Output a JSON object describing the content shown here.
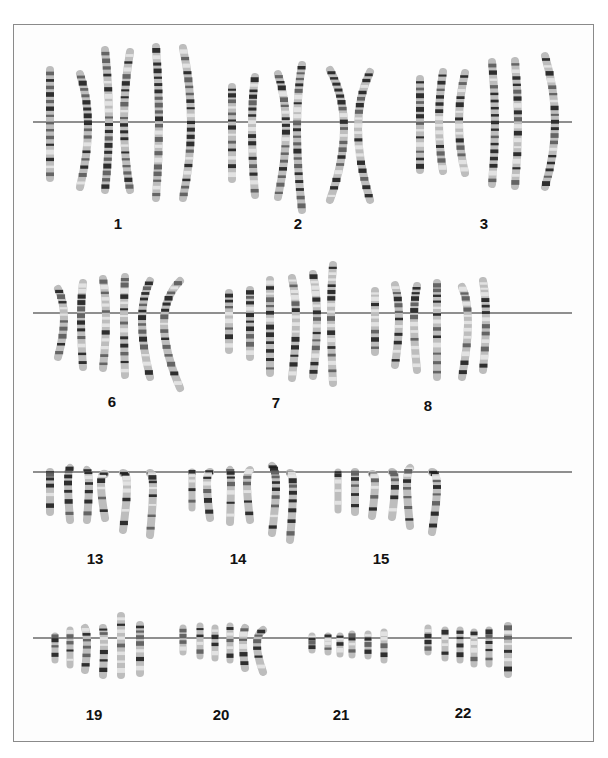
{
  "figure": {
    "type": "karyogram"
  },
  "rows": [
    {
      "line_y": 122,
      "line_x": [
        33,
        572
      ],
      "groups": [
        {
          "label": "1",
          "label_x": 118,
          "label_y": 225,
          "chromosomes": [
            {
              "x": 50,
              "top": 70,
              "bottom": 178,
              "bend": 0
            },
            {
              "x": 80,
              "top": 74,
              "bottom": 187,
              "bend": 8
            },
            {
              "x": 105,
              "top": 50,
              "bottom": 190,
              "bend": 4
            },
            {
              "x": 130,
              "top": 52,
              "bottom": 190,
              "bend": -6
            },
            {
              "x": 156,
              "top": 47,
              "bottom": 198,
              "bend": 3
            },
            {
              "x": 183,
              "top": 48,
              "bottom": 198,
              "bend": 8
            }
          ]
        },
        {
          "label": "2",
          "label_x": 298,
          "label_y": 225,
          "chromosomes": [
            {
              "x": 232,
              "top": 87,
              "bottom": 179,
              "bend": 0
            },
            {
              "x": 255,
              "top": 77,
              "bottom": 195,
              "bend": -3
            },
            {
              "x": 278,
              "top": 74,
              "bottom": 197,
              "bend": 8
            },
            {
              "x": 302,
              "top": 65,
              "bottom": 210,
              "bend": -5
            },
            {
              "x": 330,
              "top": 70,
              "bottom": 200,
              "bend": 14
            },
            {
              "x": 370,
              "top": 72,
              "bottom": 200,
              "bend": -12
            }
          ]
        },
        {
          "label": "3",
          "label_x": 484,
          "label_y": 225,
          "chromosomes": [
            {
              "x": 420,
              "top": 79,
              "bottom": 170,
              "bend": 0
            },
            {
              "x": 443,
              "top": 72,
              "bottom": 171,
              "bend": -4
            },
            {
              "x": 465,
              "top": 73,
              "bottom": 173,
              "bend": -6
            },
            {
              "x": 492,
              "top": 62,
              "bottom": 184,
              "bend": 3
            },
            {
              "x": 515,
              "top": 61,
              "bottom": 186,
              "bend": 3
            },
            {
              "x": 545,
              "top": 56,
              "bottom": 187,
              "bend": 10
            }
          ]
        }
      ]
    },
    {
      "line_y": 313,
      "line_x": [
        33,
        572
      ],
      "groups": [
        {
          "label": "6",
          "label_x": 112,
          "label_y": 403,
          "chromosomes": [
            {
              "x": 58,
              "top": 289,
              "bottom": 357,
              "bend": 6
            },
            {
              "x": 83,
              "top": 283,
              "bottom": 367,
              "bend": -2
            },
            {
              "x": 103,
              "top": 279,
              "bottom": 368,
              "bend": 3
            },
            {
              "x": 125,
              "top": 277,
              "bottom": 375,
              "bend": -1
            },
            {
              "x": 150,
              "top": 281,
              "bottom": 377,
              "bend": -8
            },
            {
              "x": 180,
              "top": 281,
              "bottom": 388,
              "bend": -16
            }
          ]
        },
        {
          "label": "7",
          "label_x": 276,
          "label_y": 404,
          "chromosomes": [
            {
              "x": 229,
              "top": 293,
              "bottom": 350,
              "bend": 0
            },
            {
              "x": 250,
              "top": 290,
              "bottom": 357,
              "bend": 0
            },
            {
              "x": 270,
              "top": 280,
              "bottom": 373,
              "bend": 0
            },
            {
              "x": 292,
              "top": 278,
              "bottom": 378,
              "bend": 4
            },
            {
              "x": 313,
              "top": 274,
              "bottom": 376,
              "bend": 4
            },
            {
              "x": 333,
              "top": 265,
              "bottom": 383,
              "bend": -2
            }
          ]
        },
        {
          "label": "8",
          "label_x": 428,
          "label_y": 407,
          "chromosomes": [
            {
              "x": 375,
              "top": 291,
              "bottom": 352,
              "bend": 0
            },
            {
              "x": 395,
              "top": 285,
              "bottom": 365,
              "bend": 4
            },
            {
              "x": 417,
              "top": 286,
              "bottom": 370,
              "bend": -3
            },
            {
              "x": 437,
              "top": 283,
              "bottom": 377,
              "bend": 0
            },
            {
              "x": 462,
              "top": 287,
              "bottom": 377,
              "bend": 6
            },
            {
              "x": 483,
              "top": 281,
              "bottom": 370,
              "bend": 3
            }
          ]
        }
      ]
    },
    {
      "line_y": 472,
      "line_x": [
        33,
        572
      ],
      "groups": [
        {
          "label": "13",
          "label_x": 95,
          "label_y": 560,
          "chromosomes": [
            {
              "x": 50,
              "top": 472,
              "bottom": 512,
              "bend": 0
            },
            {
              "x": 70,
              "top": 468,
              "bottom": 520,
              "bend": -2
            },
            {
              "x": 87,
              "top": 470,
              "bottom": 520,
              "bend": 2
            },
            {
              "x": 105,
              "top": 474,
              "bottom": 518,
              "bend": -4
            },
            {
              "x": 123,
              "top": 473,
              "bottom": 530,
              "bend": 4
            },
            {
              "x": 150,
              "top": 473,
              "bottom": 535,
              "bend": 3
            }
          ]
        },
        {
          "label": "14",
          "label_x": 238,
          "label_y": 560,
          "chromosomes": [
            {
              "x": 192,
              "top": 472,
              "bottom": 508,
              "bend": 0
            },
            {
              "x": 210,
              "top": 472,
              "bottom": 518,
              "bend": -3
            },
            {
              "x": 230,
              "top": 470,
              "bottom": 522,
              "bend": 1
            },
            {
              "x": 250,
              "top": 470,
              "bottom": 520,
              "bend": -3
            },
            {
              "x": 272,
              "top": 466,
              "bottom": 533,
              "bend": 4
            },
            {
              "x": 290,
              "top": 473,
              "bottom": 540,
              "bend": 3
            }
          ]
        },
        {
          "label": "15",
          "label_x": 381,
          "label_y": 560,
          "chromosomes": [
            {
              "x": 338,
              "top": 472,
              "bottom": 510,
              "bend": 0
            },
            {
              "x": 355,
              "top": 472,
              "bottom": 512,
              "bend": 0
            },
            {
              "x": 372,
              "top": 474,
              "bottom": 516,
              "bend": 3
            },
            {
              "x": 392,
              "top": 472,
              "bottom": 517,
              "bend": 3
            },
            {
              "x": 410,
              "top": 468,
              "bottom": 526,
              "bend": -3
            },
            {
              "x": 432,
              "top": 472,
              "bottom": 532,
              "bend": 5
            }
          ]
        }
      ]
    },
    {
      "line_y": 638,
      "line_x": [
        33,
        572
      ],
      "groups": [
        {
          "label": "19",
          "label_x": 94,
          "label_y": 716,
          "chromosomes": [
            {
              "x": 55,
              "top": 636,
              "bottom": 660,
              "bend": 0
            },
            {
              "x": 70,
              "top": 630,
              "bottom": 665,
              "bend": 0
            },
            {
              "x": 85,
              "top": 628,
              "bottom": 670,
              "bend": 2
            },
            {
              "x": 103,
              "top": 628,
              "bottom": 675,
              "bend": 1
            },
            {
              "x": 121,
              "top": 616,
              "bottom": 675,
              "bend": 0
            },
            {
              "x": 140,
              "top": 625,
              "bottom": 673,
              "bend": 0
            }
          ]
        },
        {
          "label": "20",
          "label_x": 221,
          "label_y": 716,
          "chromosomes": [
            {
              "x": 183,
              "top": 628,
              "bottom": 652,
              "bend": 0
            },
            {
              "x": 200,
              "top": 626,
              "bottom": 656,
              "bend": 0
            },
            {
              "x": 215,
              "top": 628,
              "bottom": 658,
              "bend": 0
            },
            {
              "x": 230,
              "top": 626,
              "bottom": 660,
              "bend": 0
            },
            {
              "x": 245,
              "top": 628,
              "bottom": 668,
              "bend": -2
            },
            {
              "x": 263,
              "top": 630,
              "bottom": 672,
              "bend": -6
            }
          ]
        },
        {
          "label": "21",
          "label_x": 341,
          "label_y": 716,
          "chromosomes": [
            {
              "x": 312,
              "top": 636,
              "bottom": 650,
              "bend": 0
            },
            {
              "x": 328,
              "top": 636,
              "bottom": 652,
              "bend": 0
            },
            {
              "x": 340,
              "top": 636,
              "bottom": 654,
              "bend": 0
            },
            {
              "x": 352,
              "top": 634,
              "bottom": 655,
              "bend": 0
            },
            {
              "x": 368,
              "top": 634,
              "bottom": 656,
              "bend": 0
            },
            {
              "x": 384,
              "top": 632,
              "bottom": 660,
              "bend": 0
            }
          ]
        },
        {
          "label": "22",
          "label_x": 463,
          "label_y": 714,
          "chromosomes": [
            {
              "x": 428,
              "top": 628,
              "bottom": 652,
              "bend": 0
            },
            {
              "x": 445,
              "top": 630,
              "bottom": 658,
              "bend": 0
            },
            {
              "x": 460,
              "top": 630,
              "bottom": 660,
              "bend": 0
            },
            {
              "x": 474,
              "top": 632,
              "bottom": 664,
              "bend": 0
            },
            {
              "x": 489,
              "top": 630,
              "bottom": 664,
              "bend": 0
            },
            {
              "x": 508,
              "top": 626,
              "bottom": 674,
              "bend": 0
            }
          ]
        }
      ]
    }
  ],
  "colors": {
    "frame": "#8a8a8a",
    "line": "#222222",
    "band_dark": "#2a2a2a",
    "band_light": "#d8d8d8",
    "label": "#111111"
  }
}
